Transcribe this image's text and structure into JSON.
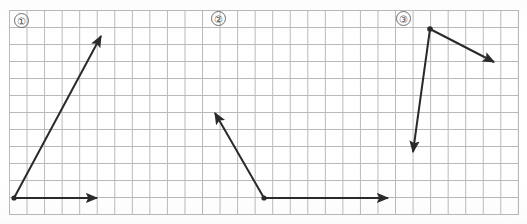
{
  "worksheet": {
    "title": "Angle diagrams worksheet",
    "width": 527,
    "height": 224,
    "background_color": "#ffffff",
    "grid": {
      "line_color": "#b9b9bd",
      "cell_width": 17.55,
      "cell_height": 17.0,
      "origin_x": 9,
      "origin_y": 10,
      "columns": 29,
      "rows": 12
    },
    "stroke_color": "#2a2a2a",
    "stroke_width": 2
  },
  "panels": [
    {
      "id": "panel-1",
      "label": "①",
      "label_text": "1",
      "label_x": 14,
      "label_y": 13,
      "description": "Acute angle opening up-right from a vertex at bottom-left",
      "vertex": {
        "x": 14,
        "y": 198
      },
      "rays": [
        {
          "name": "ray-horizontal-right",
          "from": {
            "x": 14,
            "y": 198
          },
          "to": {
            "x": 101,
            "y": 198
          },
          "arrowhead": "end"
        },
        {
          "name": "ray-up-right",
          "from": {
            "x": 14,
            "y": 198
          },
          "to": {
            "x": 104,
            "y": 30
          },
          "arrowhead": "end"
        }
      ]
    },
    {
      "id": "panel-2",
      "label": "②",
      "label_text": "2",
      "label_x": 211,
      "label_y": 11,
      "description": "Obtuse angle with vertex at bottom, one ray right, one ray up-left",
      "vertex": {
        "x": 264,
        "y": 198
      },
      "rays": [
        {
          "name": "ray-horizontal-right",
          "from": {
            "x": 264,
            "y": 198
          },
          "to": {
            "x": 392,
            "y": 198
          },
          "arrowhead": "end"
        },
        {
          "name": "ray-up-left",
          "from": {
            "x": 264,
            "y": 198
          },
          "to": {
            "x": 212,
            "y": 106
          },
          "arrowhead": "end"
        }
      ]
    },
    {
      "id": "panel-3",
      "label": "③",
      "label_text": "3",
      "label_x": 396,
      "label_y": 11,
      "description": "Acute angle with vertex at top, one ray down-left, one ray down-right",
      "vertex": {
        "x": 430,
        "y": 29
      },
      "rays": [
        {
          "name": "ray-down-right",
          "from": {
            "x": 430,
            "y": 29
          },
          "to": {
            "x": 500,
            "y": 66
          },
          "arrowhead": "end"
        },
        {
          "name": "ray-down-left",
          "from": {
            "x": 430,
            "y": 29
          },
          "to": {
            "x": 412,
            "y": 161
          },
          "arrowhead": "end"
        }
      ]
    }
  ]
}
